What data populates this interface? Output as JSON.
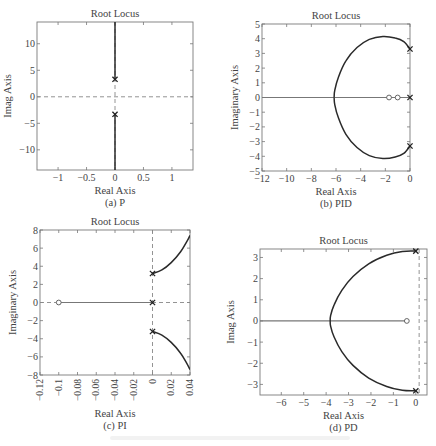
{
  "figure": {
    "footer_caption_visible": false
  },
  "chart_data": [
    {
      "id": "a",
      "type": "line",
      "title": "Root Locus",
      "subtitle": "(a) P",
      "xlabel": "Real Axis",
      "ylabel": "Imag Axis",
      "xlim": [
        -1.37,
        1.37
      ],
      "ylim": [
        -13.8,
        14.1
      ],
      "xticks": [
        -1,
        -0.5,
        0,
        0.5,
        1
      ],
      "xtick_labels": [
        "−1",
        "−0.5",
        "0",
        "0.5",
        "1"
      ],
      "yticks": [
        -10,
        -5,
        0,
        5,
        10
      ],
      "ytick_labels": [
        "−10",
        "−5",
        "0",
        "5",
        "10"
      ],
      "xtick_rotate": false,
      "grid": false,
      "frame": {
        "x0": 37,
        "y0": 22,
        "x1": 193,
        "y1": 170
      },
      "dashed_axes": {
        "horizontal": true,
        "vertical": true
      },
      "poles": [
        [
          0,
          3.3
        ],
        [
          0,
          -3.3
        ]
      ],
      "zeros": [],
      "branches": [
        {
          "name": "upper",
          "points": [
            [
              0,
              3.3
            ],
            [
              0,
              14.1
            ]
          ]
        },
        {
          "name": "lower",
          "points": [
            [
              0,
              -3.3
            ],
            [
              0,
              -13.8
            ]
          ]
        }
      ]
    },
    {
      "id": "b",
      "type": "line",
      "title": "Root Locus",
      "subtitle": "(b) PID",
      "xlabel": "Real Axis",
      "ylabel": "Imaginary Axis",
      "xlim": [
        -12,
        0
      ],
      "ylim": [
        -5,
        5
      ],
      "xticks": [
        -12,
        -10,
        -8,
        -6,
        -4,
        -2,
        0
      ],
      "xtick_labels": [
        "−12",
        "−10",
        "−8",
        "−6",
        "−4",
        "−2",
        "0"
      ],
      "yticks": [
        -5,
        -4,
        -3,
        -2,
        -1,
        0,
        1,
        2,
        3,
        4,
        5
      ],
      "ytick_labels": [
        "−5",
        "−4",
        "−3",
        "−2",
        "−1",
        "0",
        "1",
        "2",
        "3",
        "4",
        "5"
      ],
      "xtick_rotate": false,
      "grid": false,
      "frame": {
        "x0": 262,
        "y0": 24,
        "x1": 410,
        "y1": 171
      },
      "dashed_axes": {
        "horizontal": false,
        "vertical": false
      },
      "poles": [
        [
          0,
          3.3
        ],
        [
          0,
          0
        ],
        [
          0,
          -3.3
        ]
      ],
      "zeros": [
        [
          -1.7,
          0
        ],
        [
          -1.0,
          0
        ]
      ],
      "branches": [
        {
          "name": "real-axis",
          "points": [
            [
              -12,
              0
            ],
            [
              0,
              0
            ]
          ]
        },
        {
          "name": "upper-arc",
          "points": [
            [
              0,
              3.3
            ],
            [
              -0.5,
              3.8
            ],
            [
              -1.2,
              4.05
            ],
            [
              -2.2,
              4.15
            ],
            [
              -3.3,
              3.95
            ],
            [
              -4.3,
              3.4
            ],
            [
              -5.2,
              2.5
            ],
            [
              -5.8,
              1.4
            ],
            [
              -6.1,
              0.5
            ],
            [
              -6.15,
              0
            ]
          ]
        },
        {
          "name": "lower-arc",
          "points": [
            [
              0,
              -3.3
            ],
            [
              -0.5,
              -3.8
            ],
            [
              -1.2,
              -4.05
            ],
            [
              -2.2,
              -4.15
            ],
            [
              -3.3,
              -3.95
            ],
            [
              -4.3,
              -3.4
            ],
            [
              -5.2,
              -2.5
            ],
            [
              -5.8,
              -1.4
            ],
            [
              -6.1,
              -0.5
            ],
            [
              -6.15,
              0
            ]
          ]
        }
      ]
    },
    {
      "id": "c",
      "type": "line",
      "title": "Root Locus",
      "subtitle": "(c) PI",
      "xlabel": "Real Axis",
      "ylabel": "Imaginary Axis",
      "xlim": [
        -0.12,
        0.04
      ],
      "ylim": [
        -8,
        8
      ],
      "xticks": [
        -0.12,
        -0.1,
        -0.08,
        -0.06,
        -0.04,
        -0.02,
        0,
        0.02,
        0.04
      ],
      "xtick_labels": [
        "−0.12",
        "−0.1",
        "−0.08",
        "−0.06",
        "−0.04",
        "−0.02",
        "0",
        "0.02",
        "0.04"
      ],
      "yticks": [
        -8,
        -6,
        -4,
        -2,
        0,
        2,
        4,
        6,
        8
      ],
      "ytick_labels": [
        "−8",
        "−6",
        "−4",
        "−2",
        "0",
        "2",
        "4",
        "6",
        "8"
      ],
      "xtick_rotate": true,
      "grid": false,
      "frame": {
        "x0": 40,
        "y0": 230,
        "x1": 190,
        "y1": 375
      },
      "dashed_axes": {
        "horizontal": true,
        "vertical": true
      },
      "poles": [
        [
          0,
          3.2
        ],
        [
          0,
          0
        ],
        [
          0,
          -3.2
        ]
      ],
      "zeros": [
        [
          -0.1,
          0
        ]
      ],
      "branches": [
        {
          "name": "real-axis",
          "points": [
            [
              -0.1,
              0
            ],
            [
              0,
              0
            ]
          ]
        },
        {
          "name": "upper-curve",
          "points": [
            [
              0,
              3.2
            ],
            [
              0.01,
              3.6
            ],
            [
              0.02,
              4.4
            ],
            [
              0.03,
              5.6
            ],
            [
              0.037,
              6.8
            ],
            [
              0.04,
              7.4
            ]
          ]
        },
        {
          "name": "lower-curve",
          "points": [
            [
              0,
              -3.2
            ],
            [
              0.01,
              -3.6
            ],
            [
              0.02,
              -4.4
            ],
            [
              0.03,
              -5.6
            ],
            [
              0.037,
              -6.8
            ],
            [
              0.04,
              -7.4
            ]
          ]
        }
      ]
    },
    {
      "id": "d",
      "type": "line",
      "title": "Root Locus",
      "subtitle": "(d) PD",
      "xlabel": "Real Axis",
      "ylabel": "Imag Axis",
      "xlim": [
        -6.95,
        0.5
      ],
      "ylim": [
        -3.5,
        3.4
      ],
      "xticks": [
        -6,
        -5,
        -4,
        -3,
        -2,
        -1,
        0
      ],
      "xtick_labels": [
        "−6",
        "−5",
        "−4",
        "−3",
        "−2",
        "−1",
        "0"
      ],
      "yticks": [
        -3,
        -2,
        -1,
        0,
        1,
        2,
        3
      ],
      "ytick_labels": [
        "−3",
        "−2",
        "−1",
        "0",
        "1",
        "2",
        "3"
      ],
      "xtick_rotate": false,
      "grid": false,
      "frame": {
        "x0": 260,
        "y0": 249,
        "x1": 427,
        "y1": 395
      },
      "dashed_axes": {
        "horizontal": false,
        "vertical": true,
        "vertical_at": 0.15
      },
      "poles": [
        [
          0,
          3.3
        ],
        [
          0,
          -3.3
        ]
      ],
      "zeros": [
        [
          -0.4,
          0
        ]
      ],
      "branches": [
        {
          "name": "real-axis",
          "points": [
            [
              -6.95,
              0
            ],
            [
              -0.4,
              0
            ]
          ]
        },
        {
          "name": "upper-arc",
          "points": [
            [
              0,
              3.3
            ],
            [
              -0.6,
              3.28
            ],
            [
              -1.3,
              3.1
            ],
            [
              -2.1,
              2.7
            ],
            [
              -2.8,
              2.1
            ],
            [
              -3.3,
              1.45
            ],
            [
              -3.65,
              0.75
            ],
            [
              -3.8,
              0.25
            ],
            [
              -3.82,
              0
            ]
          ]
        },
        {
          "name": "lower-arc",
          "points": [
            [
              0,
              -3.3
            ],
            [
              -0.6,
              -3.28
            ],
            [
              -1.3,
              -3.1
            ],
            [
              -2.1,
              -2.7
            ],
            [
              -2.8,
              -2.1
            ],
            [
              -3.3,
              -1.45
            ],
            [
              -3.65,
              -0.75
            ],
            [
              -3.8,
              -0.25
            ],
            [
              -3.82,
              0
            ]
          ]
        }
      ]
    }
  ]
}
